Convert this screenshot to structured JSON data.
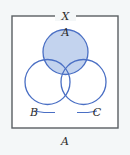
{
  "figure": {
    "caption": "A",
    "universe_label": "X",
    "labels": {
      "set_a": "A",
      "set_b": "B",
      "set_c": "C"
    },
    "colors": {
      "shading": "#c3d3ee",
      "circle_stroke": "#4a6fc4",
      "rect_stroke": "#5a5f63",
      "background": "#f4f7f8",
      "interior": "#ffffff",
      "text": "#2b2b2b"
    },
    "geometry": {
      "rect": {
        "x": 12,
        "y": 16,
        "width": 106,
        "height": 112
      },
      "circle_a": {
        "cx": 65.5,
        "cy": 52,
        "r": 22.5
      },
      "circle_b": {
        "cx": 47.5,
        "cy": 82,
        "r": 22.5
      },
      "circle_c": {
        "cx": 83.5,
        "cy": 82,
        "r": 22.5
      }
    },
    "shaded_region": "A"
  }
}
